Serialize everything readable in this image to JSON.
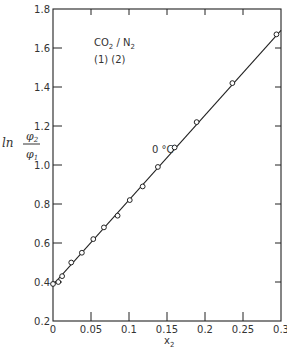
{
  "chart_data": {
    "type": "scatter",
    "title": "",
    "xlabel": "x2",
    "ylabel": "ln φ2/φ1",
    "xlim": [
      0,
      0.3
    ],
    "ylim": [
      0.2,
      1.8
    ],
    "x_ticks": [
      "0",
      "0.05",
      "0.1",
      "0.15",
      "0.2",
      "0.25",
      "0.3"
    ],
    "y_ticks": [
      "0.2",
      "0.4",
      "0.6",
      "0.8",
      "1.0",
      "1.2",
      "1.4",
      "1.6",
      "1.8"
    ],
    "grid": false,
    "annotations": [
      "CO2 / N2",
      "(1)  (2)",
      "0 °C"
    ],
    "series": [
      {
        "name": "measured",
        "marker": "open-circle",
        "x": [
          0.0,
          0.007,
          0.012,
          0.024,
          0.038,
          0.053,
          0.067,
          0.085,
          0.101,
          0.118,
          0.138,
          0.16,
          0.189,
          0.236,
          0.294
        ],
        "y": [
          0.39,
          0.4,
          0.43,
          0.5,
          0.55,
          0.62,
          0.68,
          0.74,
          0.82,
          0.89,
          0.99,
          1.09,
          1.22,
          1.42,
          1.67
        ]
      },
      {
        "name": "fit line",
        "marker": "line",
        "x": [
          0.0,
          0.3
        ],
        "y": [
          0.385,
          1.69
        ]
      }
    ]
  },
  "labels": {
    "xlabel_main": "x",
    "xlabel_sub": "2",
    "ylabel_ln": "ln",
    "ylabel_num": "φ",
    "ylabel_num_sub": "2",
    "ylabel_den": "φ",
    "ylabel_den_sub": "1",
    "system_co": "CO",
    "system_co_sub": "2",
    "system_sep": " / N",
    "system_n_sub": "2",
    "system_indices": "(1)   (2)",
    "temperature": "0 °C"
  }
}
